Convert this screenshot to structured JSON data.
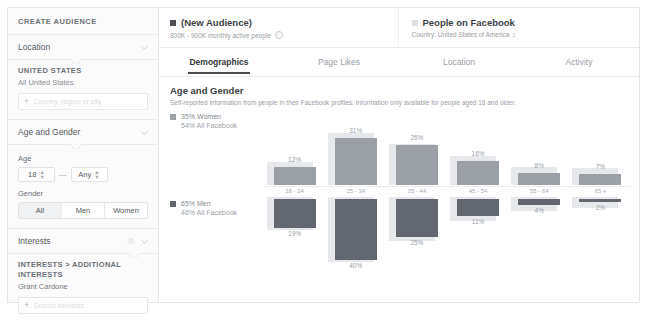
{
  "sidebar": {
    "title": "CREATE AUDIENCE",
    "location_row": {
      "label": "Location",
      "chevron": "chevron-down-icon"
    },
    "location_body": {
      "heading": "UNITED STATES",
      "sub": "All United States",
      "input_placeholder": "Country, region or city"
    },
    "age_gender_row": {
      "label": "Age and Gender",
      "chevron": "chevron-down-icon"
    },
    "age": {
      "label": "Age",
      "min_value": "18",
      "dash": "—",
      "max_value": "Any"
    },
    "gender": {
      "label": "Gender",
      "options": [
        "All",
        "Men",
        "Women"
      ],
      "selected": "All"
    },
    "interests_row": {
      "label": "Interests",
      "gear": "gear-icon",
      "chevron": "chevron-down-icon"
    },
    "interests_body": {
      "breadcrumb": "INTERESTS > ADDITIONAL INTERESTS",
      "value": "Grant Cardone",
      "input_placeholder": "Search interests"
    }
  },
  "audiences": [
    {
      "swatch": "#4a4e53",
      "name": "(New Audience)",
      "sub": "800K - 900K monthly active people",
      "info_icon": "info-icon"
    },
    {
      "swatch": "#dcdfe3",
      "name": "People on Facebook",
      "sub": "Country: United States of America",
      "footnote": "2"
    }
  ],
  "tabs": [
    {
      "label": "Demographics",
      "active": true
    },
    {
      "label": "Page Likes",
      "active": false
    },
    {
      "label": "Location",
      "active": false
    },
    {
      "label": "Activity",
      "active": false
    }
  ],
  "section": {
    "title": "Age and Gender",
    "subtitle": "Self-reported information from people in their Facebook profiles. Information only available for people aged 18 and older."
  },
  "legend": {
    "women": {
      "primary": "35% Women",
      "secondary": "54% All Facebook",
      "color": "#9ba0a6"
    },
    "men": {
      "primary": "65% Men",
      "secondary": "46% All Facebook",
      "color": "#636870"
    }
  },
  "chart_data": {
    "type": "bar",
    "title": "Age and Gender",
    "xlabel": "",
    "ylabel": "",
    "grid": false,
    "legend_position": "left",
    "categories": [
      "18 - 24",
      "25 - 34",
      "35 - 44",
      "45 - 54",
      "55 - 64",
      "65 +"
    ],
    "series": [
      {
        "name": "35% Women",
        "direction": "up",
        "color": "#9ba0a6",
        "values": [
          12,
          31,
          26,
          16,
          8,
          7
        ],
        "labels": [
          "12%",
          "31%",
          "26%",
          "16%",
          "8%",
          "7%"
        ]
      },
      {
        "name": "65% Men",
        "direction": "down",
        "color": "#636870",
        "values": [
          19,
          40,
          25,
          11,
          4,
          2
        ],
        "labels": [
          "19%",
          "40%",
          "25%",
          "11%",
          "4%",
          "2%"
        ]
      },
      {
        "name": "All Facebook (women)",
        "direction": "up",
        "color": "#e6e8eb",
        "values": [
          15,
          34,
          27,
          19,
          12,
          11
        ]
      },
      {
        "name": "All Facebook (men)",
        "direction": "down",
        "color": "#e6e8eb",
        "values": [
          22,
          43,
          29,
          16,
          9,
          7
        ]
      }
    ],
    "ylim": [
      0,
      45
    ]
  }
}
